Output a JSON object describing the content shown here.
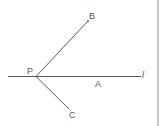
{
  "diagram": {
    "type": "geometry",
    "point_labels": {
      "P": "P",
      "A": "A",
      "B": "B",
      "C": "C"
    },
    "line_label": "l",
    "colors": {
      "stroke": "#5a5a5a",
      "text": "#555555",
      "border": "#c8c8c8"
    },
    "points": {
      "P": {
        "x": 36,
        "y": 76
      },
      "B": {
        "x": 88,
        "y": 21
      },
      "C": {
        "x": 69,
        "y": 109
      },
      "line_start": {
        "x": 8,
        "y": 76
      },
      "line_end": {
        "x": 141,
        "y": 76
      }
    }
  }
}
